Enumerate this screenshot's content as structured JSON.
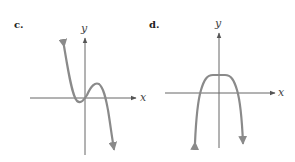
{
  "panels": [
    {
      "id": "c",
      "label": "c.",
      "x_axis_label": "x",
      "y_axis_label": "y",
      "description": "Cubic-like polynomial, negative leading coefficient: rises from lower-right to upper-left, local minimum just left of the origin, local maximum to the right of the origin"
    },
    {
      "id": "d",
      "label": "d.",
      "x_axis_label": "x",
      "y_axis_label": "y",
      "description": "Even-degree polynomial, negative leading coefficient: flat top above the x-axis, both ends go down"
    }
  ],
  "colors": {
    "axis": "#666666",
    "curve": "#8a8a8a",
    "text": "#222222"
  }
}
